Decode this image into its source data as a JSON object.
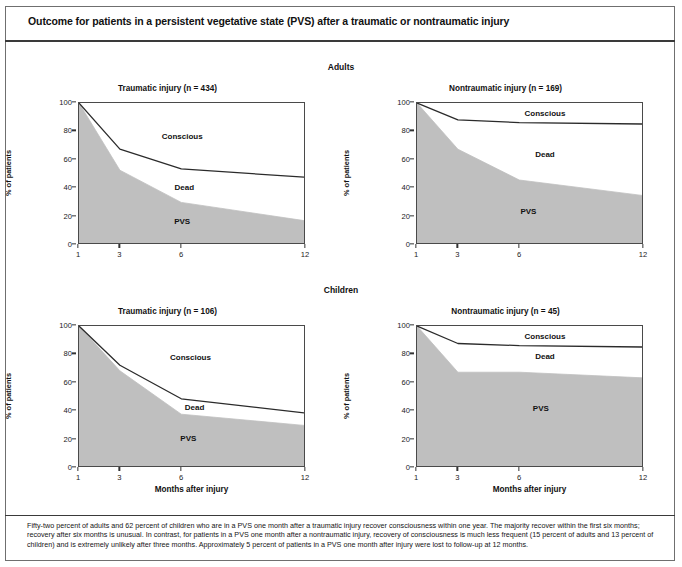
{
  "figure": {
    "title": "Outcome for patients in a persistent vegetative state (PVS) after a traumatic or nontraumatic injury",
    "footnote": "Fifty-two percent of adults and 62 percent of children who are in a PVS one month after a traumatic injury recover consciousness within one year. The majority recover within the first six months; recovery after six months is unusual. In contrast, for patients in a PVS one month after a nontraumatic injury, recovery of consciousness is much less frequent (15 percent of adults and 13 percent of children) and is extremely unlikely after three months. Approximately 5 percent of patients in a PVS one month after injury were lost to follow-up at 12 months.",
    "groups": [
      {
        "id": "adults",
        "label": "Adults"
      },
      {
        "id": "children",
        "label": "Children"
      }
    ],
    "colors": {
      "pvs_fill": "#bfbfbf",
      "dead_fill": "#ffffff",
      "conscious_fill": "#ffffff",
      "line": "#2b2b2b",
      "frame": "#4a4a4a",
      "rule": "#3a3a3a"
    }
  },
  "axes": {
    "xlabel": "Months after injury",
    "ylabel": "% of patients",
    "xticks": [
      1,
      3,
      6,
      12
    ],
    "xtick_labels": [
      "1",
      "3",
      "6",
      "12"
    ],
    "xlim": [
      1,
      12
    ],
    "yticks": [
      0,
      20,
      40,
      60,
      80,
      100
    ],
    "ytick_labels": [
      "0",
      "20",
      "40",
      "60",
      "80",
      "100"
    ],
    "ylim": [
      0,
      100
    ],
    "grid": false
  },
  "chart_data": [
    {
      "id": "adults-traumatic",
      "type": "area",
      "group": "Adults",
      "title": "Traumatic injury (n = 434)",
      "xlabel": "Months after injury",
      "ylabel": "% of patients",
      "xlim": [
        1,
        12
      ],
      "ylim": [
        0,
        100
      ],
      "x": [
        1,
        3,
        6,
        12
      ],
      "series": [
        {
          "name": "PVS",
          "values": [
            100,
            52,
            29,
            16
          ],
          "fill": "#bfbfbf"
        },
        {
          "name": "Dead",
          "values": [
            0,
            15,
            24,
            31
          ],
          "cumulative_top": [
            100,
            67,
            53,
            47
          ],
          "fill": "#ffffff"
        },
        {
          "name": "Conscious",
          "values": [
            0,
            33,
            47,
            53
          ],
          "cumulative_top": [
            100,
            100,
            100,
            100
          ],
          "fill": "#ffffff"
        }
      ],
      "annotations": [
        {
          "text": "Conscious",
          "x": 6.0,
          "y": 77
        },
        {
          "text": "Dead",
          "x": 6.1,
          "y": 41
        },
        {
          "text": "PVS",
          "x": 6.0,
          "y": 17
        }
      ]
    },
    {
      "id": "adults-nontraumatic",
      "type": "area",
      "group": "Adults",
      "title": "Nontraumatic injury (n = 169)",
      "xlabel": "Months after injury",
      "ylabel": "% of patients",
      "xlim": [
        1,
        12
      ],
      "ylim": [
        0,
        100
      ],
      "x": [
        1,
        3,
        6,
        12
      ],
      "series": [
        {
          "name": "PVS",
          "values": [
            100,
            67,
            45,
            34
          ],
          "fill": "#bfbfbf"
        },
        {
          "name": "Dead",
          "values": [
            0,
            21,
            41,
            51
          ],
          "cumulative_top": [
            100,
            88,
            86,
            85
          ],
          "fill": "#ffffff"
        },
        {
          "name": "Conscious",
          "values": [
            0,
            12,
            14,
            15
          ],
          "cumulative_top": [
            100,
            100,
            100,
            100
          ],
          "fill": "#ffffff"
        }
      ],
      "annotations": [
        {
          "text": "Conscious",
          "x": 7.2,
          "y": 93
        },
        {
          "text": "Dead",
          "x": 7.2,
          "y": 64
        },
        {
          "text": "PVS",
          "x": 6.4,
          "y": 24
        }
      ]
    },
    {
      "id": "children-traumatic",
      "type": "area",
      "group": "Children",
      "title": "Traumatic injury (n = 106)",
      "xlabel": "Months after injury",
      "ylabel": "% of patients",
      "xlim": [
        1,
        12
      ],
      "ylim": [
        0,
        100
      ],
      "x": [
        1,
        3,
        6,
        12
      ],
      "series": [
        {
          "name": "PVS",
          "values": [
            100,
            68,
            37,
            29
          ],
          "fill": "#bfbfbf"
        },
        {
          "name": "Dead",
          "values": [
            0,
            4,
            11,
            9
          ],
          "cumulative_top": [
            100,
            72,
            48,
            38
          ],
          "fill": "#ffffff"
        },
        {
          "name": "Conscious",
          "values": [
            0,
            28,
            52,
            62
          ],
          "cumulative_top": [
            100,
            100,
            100,
            100
          ],
          "fill": "#ffffff"
        }
      ],
      "annotations": [
        {
          "text": "Conscious",
          "x": 6.4,
          "y": 78
        },
        {
          "text": "Dead",
          "x": 6.6,
          "y": 43
        },
        {
          "text": "PVS",
          "x": 6.3,
          "y": 21
        }
      ]
    },
    {
      "id": "children-nontraumatic",
      "type": "area",
      "group": "Children",
      "title": "Nontraumatic injury (n = 45)",
      "xlabel": "Months after injury",
      "ylabel": "% of patients",
      "xlim": [
        1,
        12
      ],
      "ylim": [
        0,
        100
      ],
      "x": [
        1,
        3,
        6,
        12
      ],
      "series": [
        {
          "name": "PVS",
          "values": [
            100,
            67,
            67,
            63
          ],
          "fill": "#bfbfbf"
        },
        {
          "name": "Dead",
          "values": [
            0,
            20.5,
            19,
            22
          ],
          "cumulative_top": [
            100,
            87.5,
            86,
            85
          ],
          "fill": "#ffffff"
        },
        {
          "name": "Conscious",
          "values": [
            0,
            12.5,
            14,
            15
          ],
          "cumulative_top": [
            100,
            100,
            100,
            100
          ],
          "fill": "#ffffff"
        }
      ],
      "annotations": [
        {
          "text": "Conscious",
          "x": 7.2,
          "y": 93
        },
        {
          "text": "Dead",
          "x": 7.2,
          "y": 79
        },
        {
          "text": "PVS",
          "x": 7.0,
          "y": 42
        }
      ]
    }
  ],
  "panel_positions": [
    {
      "id": "adults-traumatic",
      "left": 30,
      "top": 84
    },
    {
      "id": "adults-nontraumatic",
      "left": 368,
      "top": 84
    },
    {
      "id": "children-traumatic",
      "left": 30,
      "top": 307
    },
    {
      "id": "children-nontraumatic",
      "left": 368,
      "top": 307
    }
  ]
}
